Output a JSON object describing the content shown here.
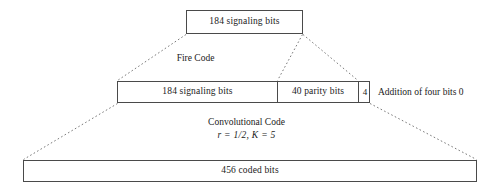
{
  "diagram": {
    "type": "block-flow",
    "line_color": "#4a4a4a",
    "dash_color": "#6b6b6b",
    "background": "#ffffff"
  },
  "top_block": {
    "label": "184 signaling bits"
  },
  "stage_fire": {
    "label": "Fire Code"
  },
  "middle_block": {
    "segments": [
      {
        "label": "184 signaling bits"
      },
      {
        "label": "40 parity bits"
      },
      {
        "label": "4"
      }
    ],
    "annotation": "Addition of four bits 0"
  },
  "stage_convolutional": {
    "label": "Convolutional Code",
    "params": "r = 1/2,  K = 5"
  },
  "bottom_block": {
    "label": "456 coded bits"
  }
}
